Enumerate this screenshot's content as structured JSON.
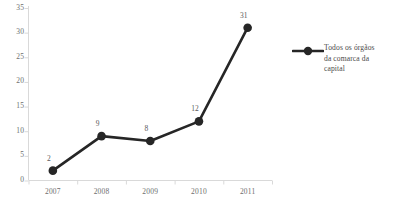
{
  "chart_data": {
    "type": "line",
    "title": "",
    "subtitle": "",
    "xlabel": "",
    "ylabel": "",
    "categories": [
      "2007",
      "2008",
      "2009",
      "2010",
      "2011"
    ],
    "series": [
      {
        "name": "Todos os órgãos da comarca da capital",
        "values": [
          2,
          9,
          8,
          12,
          31
        ],
        "color": "#262626",
        "marker": "circle",
        "data_labels": [
          "2",
          "9",
          "8",
          "12",
          "31"
        ]
      }
    ],
    "ylim": [
      0,
      35
    ],
    "yticks": [
      "0",
      "5",
      "10",
      "15",
      "20",
      "25",
      "30",
      "35"
    ],
    "ytick_values": [
      0,
      5,
      10,
      15,
      20,
      25,
      30,
      35
    ],
    "xticks": [
      "2007",
      "2008",
      "2009",
      "2010",
      "2011"
    ],
    "grid": false,
    "legend": {
      "position": "right",
      "entries": [
        {
          "label": "Todos os órgãos\nda comarca da\ncapital",
          "marker": "line-with-circle",
          "color": "#262626"
        }
      ]
    },
    "colors": {
      "series": "#262626",
      "axis": "#d9d9d9",
      "tick_text": "#6e6e6e",
      "label_text": "#5a5a5a",
      "legend_text": "#4a4a4a",
      "background": "#ffffff"
    }
  }
}
